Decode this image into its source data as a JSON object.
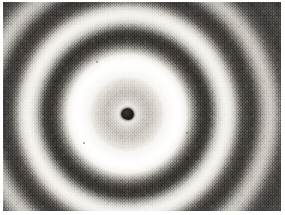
{
  "figure": {
    "name": "electron-diffraction-pattern",
    "kind": "grayscale-photograph",
    "caption": "",
    "alt_text": "Concentric diffraction rings with dark central beam stop"
  },
  "plate": {
    "background_color": "#3f3f3f",
    "margin_color": "#ffffff",
    "grain": "film-grain"
  },
  "pattern": {
    "center_x": 127,
    "center_y": 114,
    "beam_stop_radius_px": 6,
    "beam_stop_color": "#1d1b1a",
    "ring_count": 6,
    "rings": [
      {
        "order": 1,
        "type": "bright",
        "inner_radius_px": 34,
        "outer_radius_px": 60,
        "color": "#ffffff"
      },
      {
        "order": 1,
        "type": "dark",
        "inner_radius_px": 60,
        "outer_radius_px": 85,
        "color": "#3a3734"
      },
      {
        "order": 2,
        "type": "bright",
        "inner_radius_px": 85,
        "outer_radius_px": 108,
        "color": "#f6f4f1"
      },
      {
        "order": 2,
        "type": "dark",
        "inner_radius_px": 108,
        "outer_radius_px": 130,
        "color": "#413e3b"
      },
      {
        "order": 3,
        "type": "bright",
        "inner_radius_px": 130,
        "outer_radius_px": 152,
        "color": "#dedad4"
      },
      {
        "order": 3,
        "type": "dark",
        "inner_radius_px": 152,
        "outer_radius_px": 176,
        "color": "#4c4946"
      }
    ],
    "inner_halo": {
      "type": "diffuse",
      "radius_px": 34,
      "color": "#cdc8c2"
    },
    "corner_color": "#3f3c39"
  },
  "specks": [
    {
      "x": 64,
      "y": 71,
      "size": 2
    },
    {
      "x": 96,
      "y": 61,
      "size": 2
    },
    {
      "x": 151,
      "y": 45,
      "size": 2
    },
    {
      "x": 83,
      "y": 142,
      "size": 2
    },
    {
      "x": 186,
      "y": 132,
      "size": 2
    }
  ]
}
